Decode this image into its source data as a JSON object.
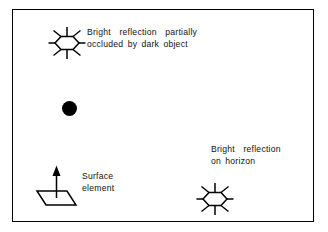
{
  "figure": {
    "background_color": "#ffffff",
    "frame_color": "#000000",
    "ink_color": "#000000"
  },
  "labels": {
    "occluded_line1": "Bright  reflection  partially",
    "occluded_line2": "occluded by dark object",
    "horizon_line1": "Bright  reflection",
    "horizon_line2": "on horizon",
    "surface_line1": "Surface",
    "surface_line2": "element"
  },
  "symbols": {
    "sun_top": "sun-burst-icon",
    "sun_bottom": "sun-burst-icon",
    "dark_object": "filled-circle-icon",
    "surface_element": "parallelogram-with-normal-arrow-icon"
  }
}
